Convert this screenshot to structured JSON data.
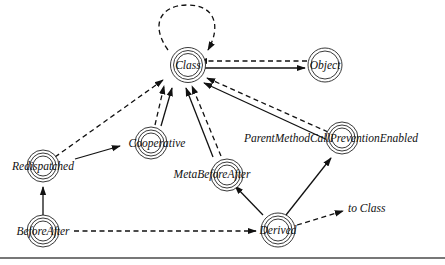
{
  "diagram": {
    "nodes": [
      {
        "id": "Class",
        "label": "Class"
      },
      {
        "id": "Object",
        "label": "Object"
      },
      {
        "id": "Redispatched",
        "label": "Redispatched"
      },
      {
        "id": "Cooperative",
        "label": "Cooperative"
      },
      {
        "id": "MetaBeforeAfter",
        "label": "MetaBeforeAfter"
      },
      {
        "id": "ParentMethodCallPreventionEnabled",
        "label": "ParentMethodCallPreventionEnabled"
      },
      {
        "id": "BeforeAfter",
        "label": "BeforeAfter"
      },
      {
        "id": "Derived",
        "label": "Derived"
      }
    ],
    "edges": [
      {
        "from": "Class",
        "to": "Class",
        "style": "dashed"
      },
      {
        "from": "Object",
        "to": "Class",
        "style": "dashed"
      },
      {
        "from": "Class",
        "to": "Object",
        "style": "solid"
      },
      {
        "from": "Redispatched",
        "to": "Class",
        "style": "dashed"
      },
      {
        "from": "Redispatched",
        "to": "Cooperative",
        "style": "solid"
      },
      {
        "from": "Cooperative",
        "to": "Class",
        "style": "dashed"
      },
      {
        "from": "Cooperative",
        "to": "Class",
        "style": "solid"
      },
      {
        "from": "MetaBeforeAfter",
        "to": "Class",
        "style": "dashed"
      },
      {
        "from": "MetaBeforeAfter",
        "to": "Class",
        "style": "solid"
      },
      {
        "from": "ParentMethodCallPreventionEnabled",
        "to": "Class",
        "style": "dashed"
      },
      {
        "from": "ParentMethodCallPreventionEnabled",
        "to": "Class",
        "style": "solid"
      },
      {
        "from": "BeforeAfter",
        "to": "Redispatched",
        "style": "solid"
      },
      {
        "from": "BeforeAfter",
        "to": "Derived",
        "style": "dashed"
      },
      {
        "from": "Derived",
        "to": "MetaBeforeAfter",
        "style": "solid"
      },
      {
        "from": "Derived",
        "to": "ParentMethodCallPreventionEnabled",
        "style": "solid"
      },
      {
        "from": "Derived",
        "to": "to Class",
        "style": "dashed"
      }
    ],
    "annotation": "to Class"
  }
}
